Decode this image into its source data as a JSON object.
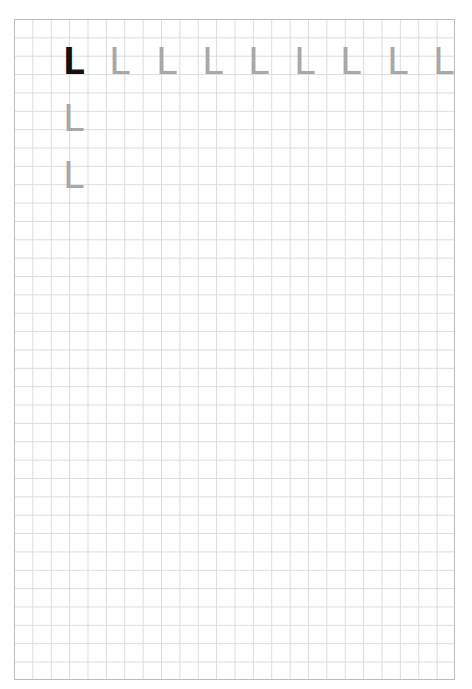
{
  "worksheet": {
    "grid": {
      "columns": 24,
      "rows": 36,
      "line_color": "#dcdcdc",
      "border_color": "#bdbdbd"
    },
    "model_letter": {
      "char": "L",
      "color": "#111111"
    },
    "trace_row": [
      "L",
      "L",
      "L",
      "L",
      "L",
      "L",
      "L",
      "L"
    ],
    "trace_column": [
      "L",
      "L"
    ],
    "trace_color": "#a8a8a8"
  }
}
